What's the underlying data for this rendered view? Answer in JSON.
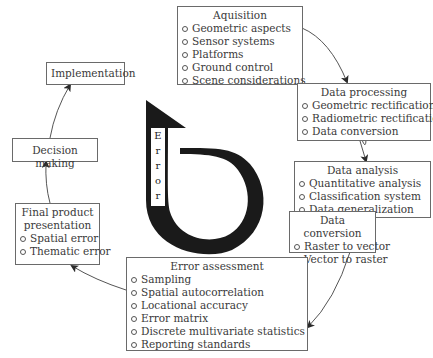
{
  "diagram": {
    "center_label": [
      "E",
      "r",
      "r",
      "o",
      "r"
    ],
    "boxes": {
      "acquisition": {
        "title": "Aquisition",
        "items": [
          "Geometric aspects",
          "Sensor systems",
          "Platforms",
          "Ground control",
          "Scene considerations"
        ]
      },
      "data_processing": {
        "title": "Data processing",
        "items": [
          "Geometric rectification",
          "Radiometric rectification",
          "Data conversion"
        ]
      },
      "data_analysis": {
        "title": "Data analysis",
        "items": [
          "Quantitative analysis",
          "Classification system",
          "Data generalization"
        ]
      },
      "data_conversion": {
        "title": "Data conversion",
        "items": [
          "Raster to vector",
          "Vector to raster"
        ]
      },
      "error_assessment": {
        "title": "Error assessment",
        "items": [
          "Sampling",
          "Spatial autocorrelation",
          "Locational accuracy",
          "Error matrix",
          "Discrete multivariate statistics",
          "Reporting standards"
        ]
      },
      "final_product": {
        "title_line1": "Final product",
        "title_line2": "presentation",
        "items": [
          "Spatial error",
          "Thematic error"
        ]
      },
      "decision_making": {
        "title": "Decision making"
      },
      "implementation": {
        "title": "Implementation"
      }
    },
    "colors": {
      "border": "#6a6a6a",
      "arrow": "#1a1a1a",
      "text": "#3a3a3a"
    }
  }
}
